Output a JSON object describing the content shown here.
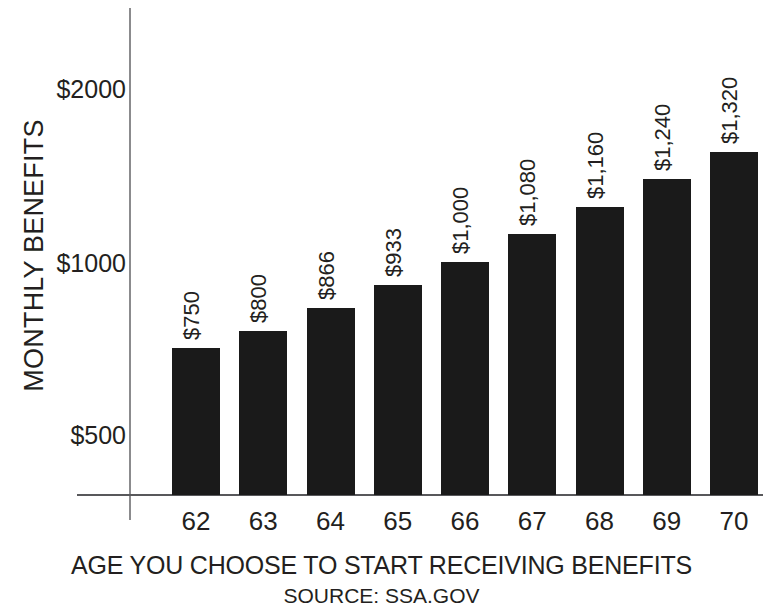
{
  "chart_data": {
    "type": "bar",
    "title": "",
    "xlabel": "AGE YOU CHOOSE TO START RECEIVING BENEFITS",
    "ylabel": "MONTHLY BENEFITS",
    "source": "SOURCE: SSA.GOV",
    "categories": [
      "62",
      "63",
      "64",
      "65",
      "66",
      "67",
      "68",
      "69",
      "70"
    ],
    "values": [
      750,
      800,
      866,
      933,
      1000,
      1080,
      1160,
      1240,
      1320
    ],
    "value_labels": [
      "$750",
      "$800",
      "$866",
      "$933",
      "$1,000",
      "$1,080",
      "$1,160",
      "$1,240",
      "$1,320"
    ],
    "y_ticks": [
      500,
      1000,
      2000
    ],
    "y_tick_labels": [
      "$500",
      "$1000",
      "$2000"
    ],
    "ylim": [
      316,
      2460
    ],
    "grid": false,
    "legend": false,
    "bar_color": "#1a1a1a",
    "axis_color": "#58585b",
    "text_color": "#231f20"
  },
  "axis": {
    "y_title": "MONTHLY BENEFITS",
    "x_title": "AGE YOU CHOOSE TO START RECEIVING BENEFITS",
    "source": "SOURCE: SSA.GOV",
    "y_tick_2000": "$2000",
    "y_tick_1000": "$1000",
    "y_tick_500": "$500"
  },
  "bars": [
    {
      "category": "62",
      "value": 750,
      "label": "$750"
    },
    {
      "category": "63",
      "value": 800,
      "label": "$800"
    },
    {
      "category": "64",
      "value": 866,
      "label": "$866"
    },
    {
      "category": "65",
      "value": 933,
      "label": "$933"
    },
    {
      "category": "66",
      "value": 1000,
      "label": "$1,000"
    },
    {
      "category": "67",
      "value": 1080,
      "label": "$1,080"
    },
    {
      "category": "68",
      "value": 1160,
      "label": "$1,160"
    },
    {
      "category": "69",
      "value": 1240,
      "label": "$1,240"
    },
    {
      "category": "70",
      "value": 1320,
      "label": "$1,320"
    }
  ]
}
